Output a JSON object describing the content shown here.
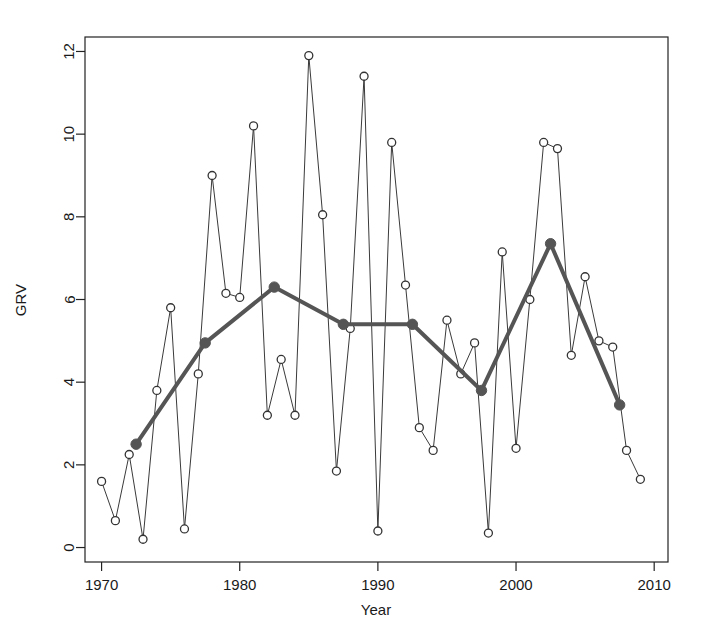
{
  "chart_data": {
    "type": "line",
    "title": "",
    "xlabel": "Year",
    "ylabel": "GRV",
    "xlim": [
      1968.8,
      2011.0
    ],
    "ylim": [
      -0.35,
      12.35
    ],
    "xticks": [
      1970,
      1980,
      1990,
      2000,
      2010
    ],
    "xtick_labels": [
      "1970",
      "1980",
      "1990",
      "2000",
      "2010"
    ],
    "yticks": [
      0,
      2,
      4,
      6,
      8,
      10,
      12
    ],
    "ytick_labels": [
      "0",
      "2",
      "4",
      "6",
      "8",
      "10",
      "12"
    ],
    "grid": false,
    "legend": null,
    "series": [
      {
        "name": "annual-grv",
        "marker": "open-circle",
        "line_width": 1,
        "color": "#3a3a3a",
        "x": [
          1970,
          1971,
          1972,
          1973,
          1974,
          1975,
          1976,
          1977,
          1978,
          1979,
          1980,
          1981,
          1982,
          1983,
          1984,
          1985,
          1986,
          1987,
          1988,
          1989,
          1990,
          1991,
          1992,
          1993,
          1994,
          1995,
          1996,
          1997,
          1998,
          1999,
          2000,
          2001,
          2002,
          2003,
          2004,
          2005,
          2006,
          2007,
          2008,
          2009
        ],
        "values": [
          1.6,
          0.65,
          2.25,
          0.2,
          3.8,
          5.8,
          0.45,
          4.2,
          9.0,
          6.15,
          6.05,
          10.2,
          3.2,
          4.55,
          3.2,
          11.9,
          8.05,
          1.85,
          5.3,
          11.4,
          0.4,
          9.8,
          6.35,
          2.9,
          2.35,
          5.5,
          4.2,
          4.95,
          0.35,
          7.15,
          2.4,
          6.0,
          9.8,
          9.65,
          4.65,
          6.55,
          5.0,
          4.85,
          2.35,
          1.65
        ]
      },
      {
        "name": "five-year-mean",
        "marker": "filled-circle",
        "line_width": 4,
        "color": "#555555",
        "x": [
          1972.5,
          1977.5,
          1982.5,
          1987.5,
          1992.5,
          1997.5,
          2002.5,
          2007.5
        ],
        "values": [
          2.5,
          4.95,
          6.3,
          5.4,
          5.4,
          3.8,
          7.35,
          3.45
        ]
      }
    ]
  },
  "axes": {
    "x_title": "Year",
    "y_title": "GRV"
  },
  "colors": {
    "thin_line": "#3a3a3a",
    "thick_line": "#555555",
    "marker_fill": "#ffffff",
    "marker_stroke": "#333333",
    "axis": "#222222",
    "background": "#ffffff"
  }
}
